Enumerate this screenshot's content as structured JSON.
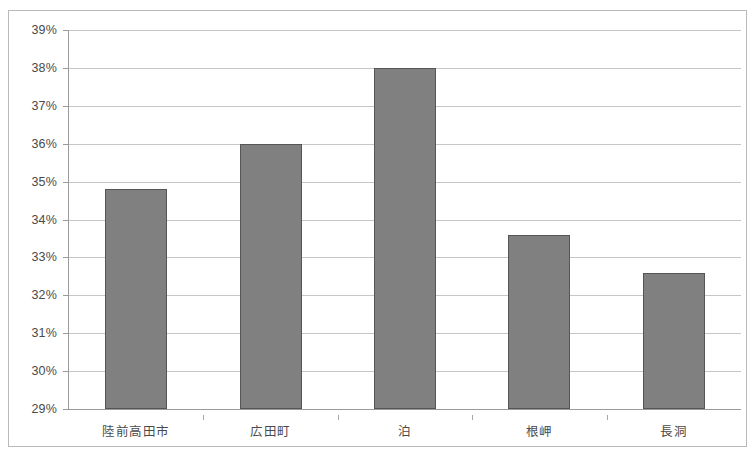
{
  "chart_data": {
    "type": "bar",
    "title": "",
    "xlabel": "",
    "ylabel": "",
    "categories": [
      "陸前高田市",
      "広田町",
      "泊",
      "根岬",
      "長洞"
    ],
    "values": [
      34.8,
      36.0,
      38.0,
      33.6,
      32.6
    ],
    "value_labels": [
      "34.8%",
      "36.0%",
      "38.0%",
      "33.6%",
      "32.6%"
    ],
    "ylim": [
      29,
      39
    ],
    "ytick_values": [
      29,
      30,
      31,
      32,
      33,
      34,
      35,
      36,
      37,
      38,
      39
    ],
    "ytick_labels": [
      "29%",
      "30%",
      "31%",
      "32%",
      "33%",
      "34%",
      "35%",
      "36%",
      "37%",
      "38%",
      "39%"
    ],
    "grid": true,
    "legend": false,
    "legend_position": "none",
    "series": [
      {
        "name": "",
        "values": [
          34.8,
          36.0,
          38.0,
          33.6,
          32.6
        ]
      }
    ],
    "colors": {
      "bar_fill": "#808080",
      "bar_border": "#555555",
      "gridline": "#c6c6c6",
      "axis": "#9a9a9a",
      "text": "#4a4a4a",
      "frame": "#b9b9b9",
      "background": "#ffffff"
    }
  }
}
